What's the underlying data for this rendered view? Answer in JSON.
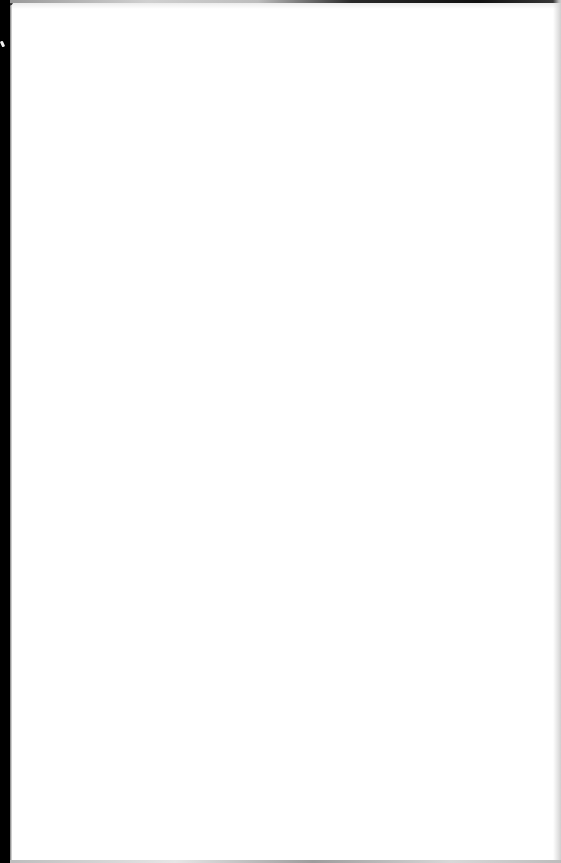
{
  "document": {
    "type": "scanned-page",
    "content": "",
    "state": "blank",
    "colors": {
      "paper": "#ffffff",
      "scan_border": "#000000",
      "edge_shadow": "#cfcfcf"
    }
  }
}
